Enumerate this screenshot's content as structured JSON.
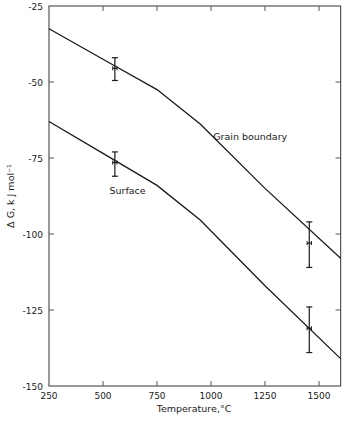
{
  "chart_data": {
    "type": "line",
    "title": "",
    "xlabel": "Temperature,°C",
    "ylabel": "Δ G, k J mol⁻¹",
    "xlim": [
      250,
      1600
    ],
    "ylim": [
      -150,
      -25
    ],
    "x_ticks": [
      250,
      500,
      750,
      1000,
      1250,
      1500
    ],
    "x_tick_labels": [
      "250",
      "500",
      "750",
      "1000",
      "1250",
      "1500"
    ],
    "y_ticks": [
      -25,
      -50,
      -75,
      -100,
      -125,
      -150
    ],
    "y_tick_labels": [
      "-25",
      "-50",
      "-75",
      "-100",
      "-125",
      "-150"
    ],
    "grid": false,
    "legend": "inline labels",
    "series": [
      {
        "name": "Grain boundary",
        "label_pos": {
          "x": 1010,
          "y": -69
        },
        "line": [
          {
            "x": 250,
            "y": -32.5
          },
          {
            "x": 500,
            "y": -42.5
          },
          {
            "x": 750,
            "y": -52.5
          },
          {
            "x": 950,
            "y": -63.8
          },
          {
            "x": 1250,
            "y": -85
          },
          {
            "x": 1600,
            "y": -108
          }
        ],
        "points": [
          {
            "x": 555,
            "y": -45.5,
            "yerr_low": -49.5,
            "yerr_high": -42,
            "xerr": 10
          },
          {
            "x": 1455,
            "y": -103,
            "yerr_low": -111,
            "yerr_high": -96,
            "xerr": 10
          }
        ]
      },
      {
        "name": "Surface",
        "label_pos": {
          "x": 530,
          "y": -87
        },
        "line": [
          {
            "x": 250,
            "y": -63
          },
          {
            "x": 500,
            "y": -73.5
          },
          {
            "x": 750,
            "y": -84
          },
          {
            "x": 950,
            "y": -95.4
          },
          {
            "x": 1250,
            "y": -117
          },
          {
            "x": 1600,
            "y": -141
          }
        ],
        "points": [
          {
            "x": 555,
            "y": -76.5,
            "yerr_low": -81,
            "yerr_high": -73,
            "xerr": 10
          },
          {
            "x": 1455,
            "y": -131,
            "yerr_low": -139,
            "yerr_high": -124,
            "xerr": 10
          }
        ]
      }
    ]
  },
  "axes": {
    "x_title": "Temperature,°C",
    "y_title": "Δ G, k J mol⁻¹"
  },
  "labels": {
    "grain_boundary": "Grain boundary",
    "surface": "Surface"
  },
  "colors": {
    "line": "#1a1a1a",
    "axis": "#555555",
    "background": "#ffffff"
  }
}
